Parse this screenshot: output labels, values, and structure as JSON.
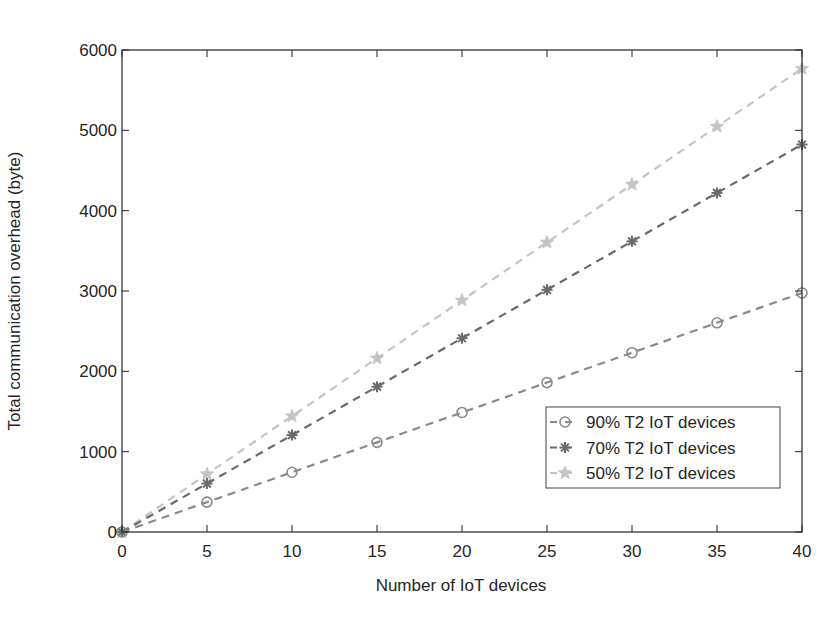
{
  "chart_data": {
    "type": "line",
    "title": "",
    "xlabel": "Number of IoT devices",
    "ylabel": "Total communication overhead (byte)",
    "x": [
      0,
      5,
      10,
      15,
      20,
      25,
      30,
      35,
      40
    ],
    "xlim": [
      0,
      40
    ],
    "ylim": [
      0,
      6000
    ],
    "xticks": [
      0,
      5,
      10,
      15,
      20,
      25,
      30,
      35,
      40
    ],
    "yticks": [
      0,
      1000,
      2000,
      3000,
      4000,
      5000,
      6000
    ],
    "grid": false,
    "legend_position": "lower right (inside)",
    "series": [
      {
        "name": "90% T2 IoT devices",
        "marker": "circle",
        "line_style": "dashed",
        "color": "#8a8a8a",
        "values": [
          0,
          372,
          744,
          1116,
          1488,
          1860,
          2232,
          2604,
          2976
        ]
      },
      {
        "name": "70% T2 IoT devices",
        "marker": "asterisk",
        "line_style": "dashed",
        "color": "#6a6a6a",
        "values": [
          0,
          603,
          1206,
          1809,
          2412,
          3015,
          3618,
          4221,
          4824
        ]
      },
      {
        "name": "50% T2 IoT devices",
        "marker": "star",
        "line_style": "dashed",
        "color": "#c4c4c4",
        "values": [
          0,
          721,
          1442,
          2163,
          2884,
          3605,
          4326,
          5047,
          5768
        ]
      }
    ]
  }
}
